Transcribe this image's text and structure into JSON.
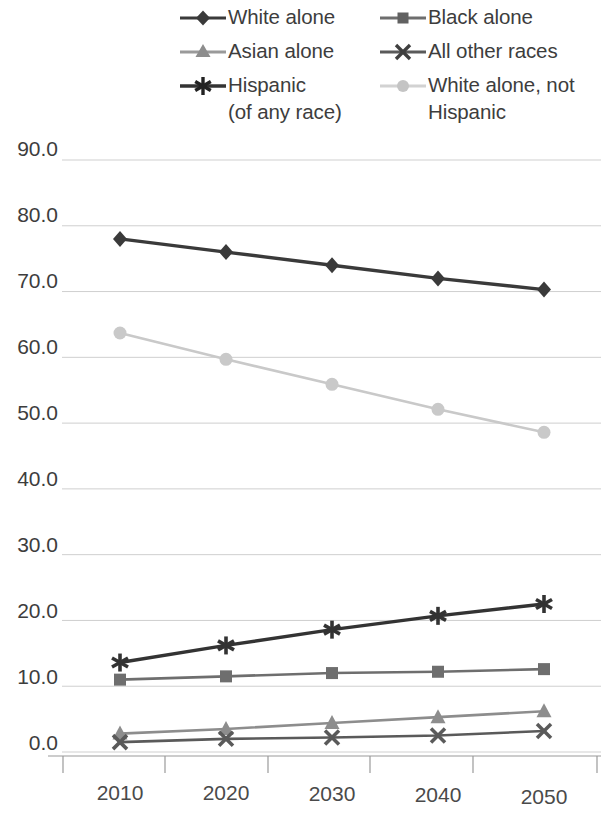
{
  "chart_data": {
    "type": "line",
    "title": "",
    "subtitle": "",
    "xlabel": "",
    "ylabel": "",
    "categories": [
      "2010",
      "2020",
      "2030",
      "2040",
      "2050"
    ],
    "x": [
      2010,
      2020,
      2030,
      2040,
      2050
    ],
    "ylim": [
      0.0,
      90.0
    ],
    "ytick_labels": [
      "90.0",
      "80.0",
      "70.0",
      "60.0",
      "50.0",
      "40.0",
      "30.0",
      "20.0",
      "10.0",
      "0.0"
    ],
    "yticks": [
      90.0,
      80.0,
      70.0,
      60.0,
      50.0,
      40.0,
      30.0,
      20.0,
      10.0,
      0.0
    ],
    "grid": true,
    "legend_position": "top",
    "series": [
      {
        "name": "White alone",
        "marker": "diamond",
        "color": "#3a3a3a",
        "values": [
          78.0,
          76.0,
          74.0,
          72.0,
          70.3
        ]
      },
      {
        "name": "Black alone",
        "marker": "square",
        "color": "#6e6e6e",
        "values": [
          11.0,
          11.5,
          12.0,
          12.2,
          12.6
        ]
      },
      {
        "name": "Asian alone",
        "marker": "triangle",
        "color": "#8d8d8d",
        "values": [
          2.8,
          3.5,
          4.4,
          5.3,
          6.2
        ]
      },
      {
        "name": "All other races",
        "marker": "x-cross",
        "color": "#5a5a5a",
        "values": [
          1.5,
          2.0,
          2.2,
          2.5,
          3.2
        ]
      },
      {
        "name": "Hispanic (of any race)",
        "marker": "asterisk",
        "color": "#333333",
        "values": [
          13.6,
          16.2,
          18.6,
          20.7,
          22.5
        ]
      },
      {
        "name": "White alone, not Hispanic",
        "marker": "circle",
        "color": "#c9c9c9",
        "values": [
          63.7,
          59.7,
          55.9,
          52.1,
          48.6
        ]
      }
    ]
  },
  "legend": {
    "columns": [
      {
        "items": [
          {
            "label": "White alone",
            "label_line2": "",
            "marker": "diamond",
            "color": "#3a3a3a",
            "icon": "diamond-marker-icon"
          },
          {
            "label": "Asian alone",
            "label_line2": "",
            "marker": "triangle",
            "color": "#8d8d8d",
            "icon": "triangle-marker-icon"
          },
          {
            "label": "Hispanic",
            "label_line2": "(of any race)",
            "marker": "asterisk",
            "color": "#333333",
            "icon": "asterisk-marker-icon"
          }
        ]
      },
      {
        "items": [
          {
            "label": "Black alone",
            "label_line2": "",
            "marker": "square",
            "color": "#6e6e6e",
            "icon": "square-marker-icon"
          },
          {
            "label": "All other races",
            "label_line2": "",
            "marker": "x-cross",
            "color": "#5a5a5a",
            "icon": "x-cross-marker-icon"
          },
          {
            "label": "White alone, not",
            "label_line2": "Hispanic",
            "marker": "circle",
            "color": "#c9c9c9",
            "icon": "circle-marker-icon"
          }
        ]
      }
    ]
  },
  "axis": {
    "y_labels": [
      "90.0",
      "80.0",
      "70.0",
      "60.0",
      "50.0",
      "40.0",
      "30.0",
      "20.0",
      "10.0",
      "0.0"
    ],
    "x_labels": [
      "2010",
      "2020",
      "2030",
      "2040",
      "2050"
    ]
  },
  "colors": {
    "grid": "#cfcfcf",
    "axis": "#9a9a9a",
    "text": "#3d3d3d",
    "white_alone": "#3a3a3a",
    "black_alone": "#6e6e6e",
    "asian_alone": "#8d8d8d",
    "all_other_races": "#5a5a5a",
    "hispanic": "#333333",
    "white_not_hispanic": "#c9c9c9"
  }
}
